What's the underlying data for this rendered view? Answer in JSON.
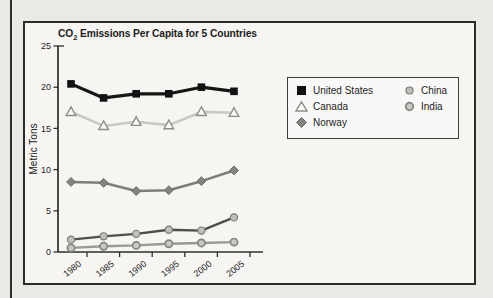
{
  "colors": {
    "page_bg": "#ebe9e6",
    "chart_bg": "#f6f5f2",
    "frame_border": "#2b2b2b",
    "axis": "#2e2e2e",
    "text": "#1d1d1d",
    "legend_bg": "#f9f8f6",
    "legend_border": "#3c3c3c"
  },
  "chart_data": {
    "type": "line",
    "title_prefix": "CO",
    "title_sub": "2",
    "title_suffix": " Emissions Per Capita for 5 Countries",
    "ylabel": "Metric Tons",
    "ylim": [
      0,
      25
    ],
    "y_ticks": [
      0,
      5,
      10,
      15,
      20,
      25
    ],
    "grid": false,
    "legend_position": "upper-right-inside",
    "categories": [
      "1980",
      "1985",
      "1990",
      "1995",
      "2000",
      "2005"
    ],
    "series": [
      {
        "name": "United States",
        "marker": "square",
        "values": [
          20.4,
          18.7,
          19.2,
          19.2,
          20.0,
          19.5
        ],
        "line_color": "#161616",
        "line_width": 3.2,
        "marker_fill": "#121212",
        "marker_stroke": "#121212",
        "marker_stroke_width": 1
      },
      {
        "name": "Canada",
        "marker": "triangle",
        "values": [
          17.0,
          15.3,
          15.8,
          15.4,
          17.0,
          16.9
        ],
        "line_color": "#c9c8c5",
        "line_width": 2.6,
        "marker_fill": "#f9f8f5",
        "marker_stroke": "#8d8d8a",
        "marker_stroke_width": 1.4
      },
      {
        "name": "Norway",
        "marker": "diamond",
        "values": [
          8.5,
          8.4,
          7.4,
          7.5,
          8.6,
          9.9
        ],
        "line_color": "#7d7d7a",
        "line_width": 2.6,
        "marker_fill": "#83837f",
        "marker_stroke": "#686865",
        "marker_stroke_width": 1
      },
      {
        "name": "China",
        "marker": "circle",
        "values": [
          1.5,
          1.9,
          2.2,
          2.7,
          2.6,
          4.2
        ],
        "line_color": "#4e4e4b",
        "line_width": 2.4,
        "marker_fill": "#c0bfbc",
        "marker_stroke": "#7b7b78",
        "marker_stroke_width": 1.2
      },
      {
        "name": "India",
        "marker": "circle",
        "values": [
          0.5,
          0.7,
          0.8,
          1.0,
          1.1,
          1.2
        ],
        "line_color": "#999996",
        "line_width": 2.4,
        "marker_fill": "#c9c8c5",
        "marker_stroke": "#858582",
        "marker_stroke_width": 1.7
      }
    ]
  }
}
